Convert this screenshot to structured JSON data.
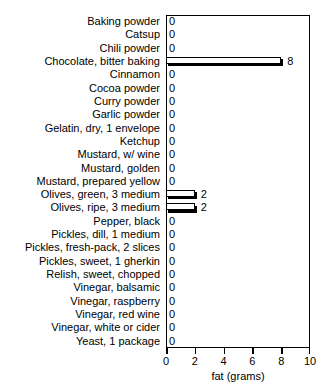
{
  "chart_data": {
    "type": "bar",
    "orientation": "horizontal",
    "title": "MISCELLANEOUS FOODS",
    "xlabel": "fat (grams)",
    "ylabel": "",
    "xlim": [
      0,
      10
    ],
    "xticks": [
      0,
      2,
      4,
      6,
      8,
      10
    ],
    "grid": false,
    "legend": null,
    "categories": [
      "Baking powder",
      "Catsup",
      "Chili powder",
      "Chocolate, bitter baking",
      "Cinnamon",
      "Cocoa powder",
      "Curry powder",
      "Garlic powder",
      "Gelatin, dry, 1 envelope",
      "Ketchup",
      "Mustard, w/ wine",
      "Mustard, golden",
      "Mustard, prepared yellow",
      "Olives, green, 3 medium",
      "Olives, ripe, 3 medium",
      "Pepper, black",
      "Pickles, dill, 1 medium",
      "Pickles, fresh-pack, 2 slices",
      "Pickles, sweet, 1 gherkin",
      "Relish, sweet, chopped",
      "Vinegar, balsamic",
      "Vinegar, raspberry",
      "Vinegar, red wine",
      "Vinegar, white or cider",
      "Yeast, 1 package"
    ],
    "values": [
      0,
      0,
      0,
      8,
      0,
      0,
      0,
      0,
      0,
      0,
      0,
      0,
      0,
      2,
      2,
      0,
      0,
      0,
      0,
      0,
      0,
      0,
      0,
      0,
      0
    ],
    "value_labels": [
      "0",
      "0",
      "0",
      "8",
      "0",
      "0",
      "0",
      "0",
      "0",
      "0",
      "0",
      "0",
      "0",
      "2",
      "2",
      "0",
      "0",
      "0",
      "0",
      "0",
      "0",
      "0",
      "0",
      "0",
      "0"
    ],
    "xticklabels": [
      "0",
      "2",
      "4",
      "6",
      "8",
      "10"
    ],
    "colors": {
      "bar_fill": "#ffffff",
      "bar_edge": "#000000",
      "bar_shadow": "#000000",
      "axis": "#000000",
      "text": "#000000",
      "background": "#ffffff"
    }
  }
}
